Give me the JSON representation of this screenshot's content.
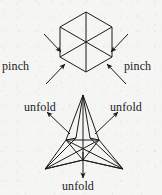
{
  "figure": {
    "background_color": "#f5f5f4",
    "ink_color": "#1b1b1b",
    "width": 162,
    "height": 195,
    "labels": {
      "pinch_left": "pinch",
      "pinch_right": "pinch",
      "unfold_left": "unfold",
      "unfold_right": "unfold",
      "unfold_bottom": "unfold"
    },
    "shapes": {
      "top": {
        "name": "hexagon-cube-projection",
        "description": "regular hexagon with three internal spokes from centre to alternating vertices plus a vertical axis",
        "center": [
          86,
          42
        ],
        "radius": 30,
        "vertices": [
          [
            86,
            12
          ],
          [
            112,
            27
          ],
          [
            112,
            57
          ],
          [
            86,
            72
          ],
          [
            60,
            57
          ],
          [
            60,
            27
          ]
        ]
      },
      "bottom": {
        "name": "three-pointed-star-stellated-tetrahedron",
        "description": "three-pointed star outline with inner triangle and internal edge lines",
        "center": [
          83,
          146
        ],
        "tips": [
          [
            83,
            95
          ],
          [
            45,
            169
          ],
          [
            123,
            169
          ]
        ],
        "inner": [
          [
            66,
            140
          ],
          [
            99,
            140
          ],
          [
            83,
            160
          ]
        ]
      }
    },
    "arrows": {
      "pinch": [
        {
          "name": "pinch-arrow-upper-left",
          "from": [
            44,
            37
          ],
          "to": [
            62,
            53
          ],
          "direction": "inward"
        },
        {
          "name": "pinch-arrow-lower-left",
          "from": [
            47,
            82
          ],
          "to": [
            66,
            63
          ],
          "direction": "inward"
        },
        {
          "name": "pinch-arrow-upper-right",
          "from": [
            128,
            37
          ],
          "to": [
            110,
            53
          ],
          "direction": "inward"
        },
        {
          "name": "pinch-arrow-lower-right",
          "from": [
            125,
            82
          ],
          "to": [
            106,
            63
          ],
          "direction": "inward"
        }
      ],
      "unfold": [
        {
          "name": "unfold-arrow-left",
          "from": [
            69,
            133
          ],
          "to": [
            48,
            113
          ],
          "direction": "outward"
        },
        {
          "name": "unfold-arrow-right",
          "from": [
            95,
            133
          ],
          "to": [
            117,
            113
          ],
          "direction": "outward"
        },
        {
          "name": "unfold-arrow-bottom",
          "from": [
            83,
            152
          ],
          "to": [
            83,
            176
          ],
          "direction": "outward"
        }
      ]
    }
  }
}
